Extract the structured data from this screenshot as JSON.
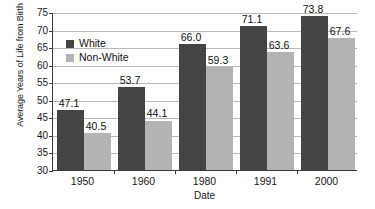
{
  "chart_data": {
    "type": "bar",
    "title": "",
    "xlabel": "Date",
    "ylabel": "Average Years of Life from Birth",
    "categories": [
      "1950",
      "1960",
      "1980",
      "1991",
      "2000"
    ],
    "series": [
      {
        "name": "White",
        "color": "#444444",
        "values": [
          47.1,
          53.7,
          66.0,
          71.1,
          73.8
        ]
      },
      {
        "name": "Non-White",
        "color": "#b3b3b3",
        "values": [
          40.5,
          44.1,
          59.3,
          63.6,
          67.6
        ]
      }
    ],
    "value_labels": {
      "White": [
        "47.1",
        "53.7",
        "66.0",
        "71.1",
        "73.8"
      ],
      "Non-White": [
        "40.5",
        "44.1",
        "59.3",
        "63.6",
        "67.6"
      ]
    },
    "ylim": [
      30,
      75
    ],
    "ytick_labels": [
      "30",
      "35",
      "40",
      "45",
      "50",
      "55",
      "60",
      "65",
      "70",
      "75"
    ],
    "ytick_values": [
      30,
      35,
      40,
      45,
      50,
      55,
      60,
      65,
      70,
      75
    ],
    "grid": true,
    "legend_position": "inside-top-left"
  },
  "legend": {
    "entries": [
      {
        "label": "White"
      },
      {
        "label": "Non-White"
      }
    ]
  },
  "axes": {
    "x_title": "Date",
    "y_title": "Average Years of Life from Birth"
  }
}
